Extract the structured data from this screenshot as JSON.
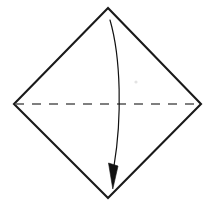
{
  "figure": {
    "background_color": "#ffffff",
    "width": 214,
    "height": 208,
    "caption": ""
  },
  "shape": {
    "name": "square-rotated-45-diamond",
    "edge_color": "#1a1a1a",
    "fill_color": "#ffffff",
    "edge_width": 2.1,
    "vertices": {
      "top": [
        108,
        8
      ],
      "right": [
        201,
        104
      ],
      "bottom": [
        108,
        198
      ],
      "left": [
        14,
        104
      ]
    },
    "points_path": "108,8 201,104 108,198 14,104"
  },
  "fold_line": {
    "name": "horizontal-valley-fold",
    "style": "dashed",
    "color": "#555555",
    "dash_pattern": "9 8",
    "width": 1.3,
    "from": [
      15,
      104
    ],
    "to": [
      200,
      104
    ],
    "path": "M 15 104 L 200 104"
  },
  "arrow": {
    "name": "fold-direction-arrow",
    "style": "curved",
    "color": "#111111",
    "stroke_width": 1.2,
    "start": [
      110,
      20
    ],
    "end": [
      113,
      189
    ],
    "curve_path": "M 110 20 C 121 58 122 118 114 166",
    "head": {
      "shape": "filled-triangle",
      "tip": [
        113,
        189
      ],
      "base_left": [
        108,
        164
      ],
      "base_right": [
        118,
        166
      ],
      "path": "M 108.5 163 L 118 166 L 112.8 189 Z"
    }
  },
  "artifacts": {
    "speck": {
      "cx": 136,
      "cy": 82,
      "r": 1.6,
      "color": "#e3e3e3"
    }
  }
}
